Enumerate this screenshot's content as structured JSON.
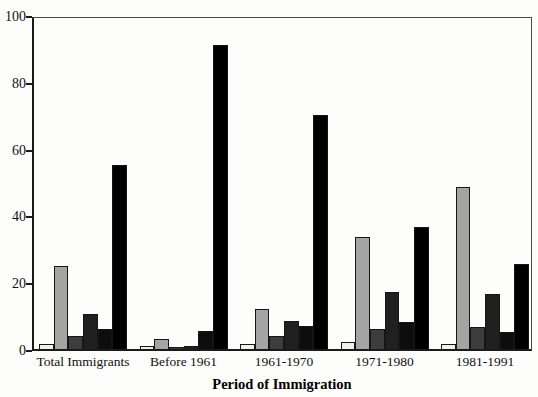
{
  "chart_data": {
    "type": "bar",
    "title": "",
    "xlabel": "Period of Immigration",
    "ylabel": "",
    "ylim": [
      0,
      100
    ],
    "yticks": [
      0,
      20,
      40,
      60,
      80,
      100
    ],
    "grid": false,
    "legend_position": "none",
    "categories": [
      "Total Immigrants",
      "Before 1961",
      "1961-1970",
      "1971-1980",
      "1981-1991"
    ],
    "series": [
      {
        "name": "series-1",
        "color": "#f2f0ea",
        "values": [
          1.5,
          1,
          1.5,
          2,
          1.5
        ]
      },
      {
        "name": "series-2",
        "color": "#a4a4a4",
        "values": [
          25,
          3,
          12,
          33.5,
          48.5
        ]
      },
      {
        "name": "series-3",
        "color": "#3d3d3d",
        "values": [
          4,
          0.5,
          4,
          6,
          6.5
        ]
      },
      {
        "name": "series-4",
        "color": "#202020",
        "values": [
          10.5,
          1,
          8.5,
          17,
          16.5
        ]
      },
      {
        "name": "series-5",
        "color": "#0d0d0d",
        "values": [
          6,
          5.5,
          7,
          8,
          5
        ]
      },
      {
        "name": "series-6",
        "color": "#000000",
        "values": [
          55,
          91,
          70,
          36.5,
          25.5
        ]
      }
    ],
    "frame": {
      "axis_color": "#1a1a1a",
      "box_color": "#4a4a4a"
    }
  }
}
